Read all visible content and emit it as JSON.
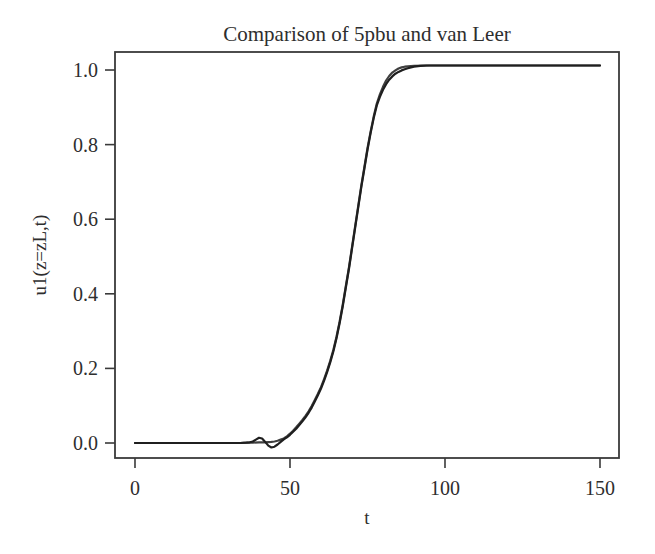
{
  "chart_data": {
    "type": "line",
    "title": "Comparison of 5pbu and van Leer",
    "xlabel": "t",
    "ylabel": "u1(z=zL,t)",
    "xlim": [
      -6.45,
      156.13
    ],
    "ylim": [
      -0.0402,
      1.0483
    ],
    "grid": false,
    "legend": "none",
    "frame": "box",
    "line_color": "#2a2a2a",
    "frame_color": "#3a3a3a",
    "xticks": {
      "values": [
        0,
        50,
        100,
        150
      ],
      "labels": [
        "0",
        "50",
        "100",
        "150"
      ]
    },
    "yticks": {
      "values": [
        0.0,
        0.2,
        0.4,
        0.6,
        0.8,
        1.0
      ],
      "labels": [
        "0.0",
        "0.2",
        "0.4",
        "0.6",
        "0.8",
        "1.0"
      ]
    },
    "series": [
      {
        "name": "van Leer",
        "color": "#3f3f3f",
        "points": [
          [
            0,
            0
          ],
          [
            5,
            0
          ],
          [
            10,
            0
          ],
          [
            15,
            0
          ],
          [
            20,
            0
          ],
          [
            25,
            0
          ],
          [
            30,
            0
          ],
          [
            34,
            0
          ],
          [
            36,
            0.001
          ],
          [
            38,
            0.001
          ],
          [
            40,
            0.002
          ],
          [
            42,
            0.002
          ],
          [
            44,
            0.003
          ],
          [
            45,
            0.004
          ],
          [
            46,
            0.006
          ],
          [
            47,
            0.009
          ],
          [
            48,
            0.012
          ],
          [
            49,
            0.018
          ],
          [
            50,
            0.025
          ],
          [
            51,
            0.033
          ],
          [
            52,
            0.042
          ],
          [
            53,
            0.052
          ],
          [
            54,
            0.062
          ],
          [
            55,
            0.073
          ],
          [
            56,
            0.085
          ],
          [
            57,
            0.099
          ],
          [
            58,
            0.115
          ],
          [
            59,
            0.132
          ],
          [
            60,
            0.15
          ],
          [
            61,
            0.171
          ],
          [
            62,
            0.195
          ],
          [
            63,
            0.221
          ],
          [
            64,
            0.25
          ],
          [
            65,
            0.285
          ],
          [
            66,
            0.325
          ],
          [
            67,
            0.37
          ],
          [
            68,
            0.42
          ],
          [
            69,
            0.47
          ],
          [
            70,
            0.525
          ],
          [
            71,
            0.58
          ],
          [
            72,
            0.635
          ],
          [
            73,
            0.69
          ],
          [
            74,
            0.74
          ],
          [
            75,
            0.79
          ],
          [
            76,
            0.835
          ],
          [
            77,
            0.875
          ],
          [
            78,
            0.91
          ],
          [
            79,
            0.935
          ],
          [
            80,
            0.955
          ],
          [
            81,
            0.972
          ],
          [
            82,
            0.984
          ],
          [
            83,
            0.993
          ],
          [
            84,
            0.999
          ],
          [
            85,
            1.004
          ],
          [
            86,
            1.007
          ],
          [
            87,
            1.009
          ],
          [
            88,
            1.01
          ],
          [
            90,
            1.011
          ],
          [
            95,
            1.012
          ],
          [
            100,
            1.012
          ],
          [
            110,
            1.012
          ],
          [
            120,
            1.012
          ],
          [
            130,
            1.012
          ],
          [
            140,
            1.012
          ],
          [
            150,
            1.012
          ]
        ]
      },
      {
        "name": "5pbu",
        "color": "#1f1f1f",
        "points": [
          [
            0,
            0
          ],
          [
            5,
            0
          ],
          [
            10,
            0
          ],
          [
            15,
            0
          ],
          [
            20,
            0
          ],
          [
            25,
            0
          ],
          [
            30,
            0
          ],
          [
            34,
            0
          ],
          [
            36,
            0.001
          ],
          [
            37,
            0.002
          ],
          [
            38,
            0.004
          ],
          [
            39,
            0.009
          ],
          [
            40,
            0.014
          ],
          [
            41,
            0.012
          ],
          [
            42,
            0.003
          ],
          [
            43,
            -0.007
          ],
          [
            44,
            -0.012
          ],
          [
            45,
            -0.01
          ],
          [
            46,
            -0.004
          ],
          [
            47,
            0.003
          ],
          [
            48,
            0.01
          ],
          [
            49,
            0.015
          ],
          [
            50,
            0.022
          ],
          [
            51,
            0.03
          ],
          [
            52,
            0.038
          ],
          [
            53,
            0.048
          ],
          [
            54,
            0.058
          ],
          [
            55,
            0.069
          ],
          [
            56,
            0.081
          ],
          [
            57,
            0.095
          ],
          [
            58,
            0.111
          ],
          [
            59,
            0.128
          ],
          [
            60,
            0.146
          ],
          [
            61,
            0.167
          ],
          [
            62,
            0.191
          ],
          [
            63,
            0.217
          ],
          [
            64,
            0.246
          ],
          [
            65,
            0.281
          ],
          [
            66,
            0.321
          ],
          [
            67,
            0.366
          ],
          [
            68,
            0.416
          ],
          [
            69,
            0.466
          ],
          [
            70,
            0.521
          ],
          [
            71,
            0.576
          ],
          [
            72,
            0.631
          ],
          [
            73,
            0.686
          ],
          [
            74,
            0.736
          ],
          [
            75,
            0.786
          ],
          [
            76,
            0.831
          ],
          [
            77,
            0.871
          ],
          [
            78,
            0.905
          ],
          [
            79,
            0.928
          ],
          [
            80,
            0.947
          ],
          [
            81,
            0.962
          ],
          [
            82,
            0.974
          ],
          [
            83,
            0.983
          ],
          [
            84,
            0.99
          ],
          [
            85,
            0.995
          ],
          [
            86,
            0.999
          ],
          [
            87,
            1.002
          ],
          [
            88,
            1.005
          ],
          [
            89,
            1.007
          ],
          [
            90,
            1.009
          ],
          [
            92,
            1.011
          ],
          [
            94,
            1.012
          ],
          [
            100,
            1.012
          ],
          [
            110,
            1.012
          ],
          [
            120,
            1.012
          ],
          [
            130,
            1.012
          ],
          [
            140,
            1.012
          ],
          [
            150,
            1.012
          ]
        ]
      }
    ]
  }
}
